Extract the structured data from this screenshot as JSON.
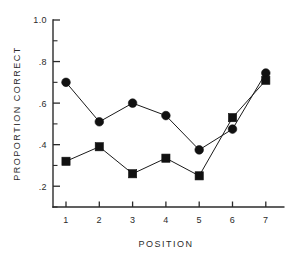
{
  "chart_data": {
    "type": "line",
    "title": "",
    "xlabel": "POSITION",
    "ylabel": "PROPORTION CORRECT",
    "x": [
      1,
      2,
      3,
      4,
      5,
      6,
      7
    ],
    "categories": [
      "1",
      "2",
      "3",
      "4",
      "5",
      "6",
      "7"
    ],
    "xlim": [
      0.55,
      7.45
    ],
    "ylim": [
      0.1,
      1.0
    ],
    "grid": false,
    "legend": "none",
    "x_tick_labels": [
      "1",
      "2",
      "3",
      "4",
      "5",
      "6",
      "7"
    ],
    "y_tick_labels": [
      "1.0",
      ".8",
      ".6",
      ".4",
      ".2"
    ],
    "y_tick_values": [
      1.0,
      0.8,
      0.6,
      0.4,
      0.2
    ],
    "y_minor_tick_values": [
      0.9,
      0.7,
      0.5,
      0.3,
      0.1
    ],
    "series": [
      {
        "name": "circle-series",
        "marker": "filled-circle",
        "values": [
          0.7,
          0.51,
          0.6,
          0.54,
          0.375,
          0.475,
          0.745
        ]
      },
      {
        "name": "square-series",
        "marker": "filled-square",
        "values": [
          0.32,
          0.39,
          0.26,
          0.335,
          0.25,
          0.53,
          0.71
        ]
      }
    ]
  },
  "style": {
    "axis_color": "#2b2b2b",
    "marker_color": "#111111",
    "line_color": "#1a1a1a",
    "background": "#ffffff"
  }
}
